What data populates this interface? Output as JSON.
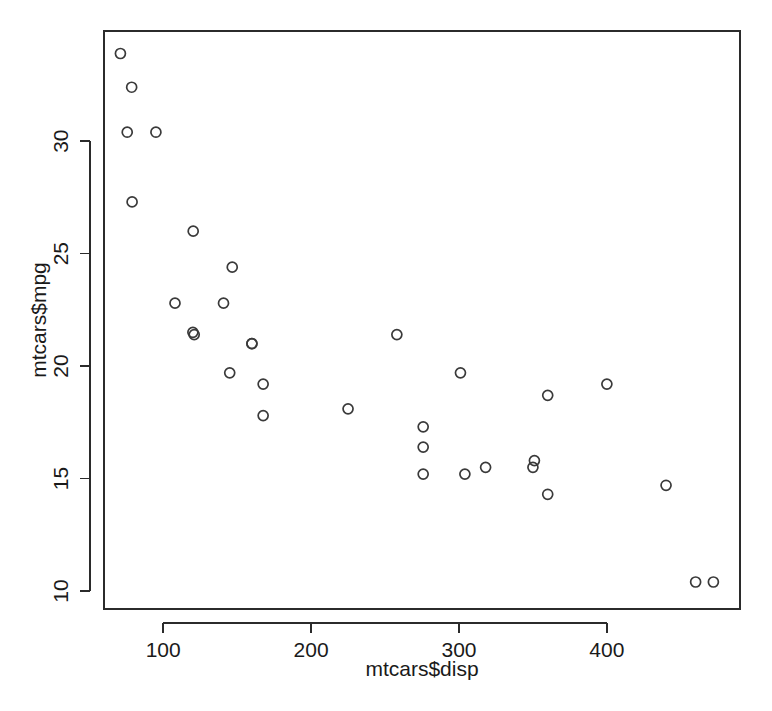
{
  "figure": {
    "background_color": "#ffffff",
    "foreground_color": "#1a1a1a",
    "point_color": "#3a3a3a",
    "axis_color": "#2b2b2b"
  },
  "chart_data": {
    "type": "scatter",
    "title": "",
    "subtitle": "",
    "xlabel": "mtcars$disp",
    "ylabel": "mtcars$mpg",
    "xlim": [
      60.0,
      490.0
    ],
    "ylim": [
      9.2,
      34.9
    ],
    "xticks": [
      100,
      200,
      300,
      400
    ],
    "yticks": [
      10,
      15,
      20,
      25,
      30
    ],
    "xtick_labels": [
      "100",
      "200",
      "300",
      "400"
    ],
    "ytick_labels": [
      "10",
      "15",
      "20",
      "25",
      "30"
    ],
    "grid": false,
    "legend": false,
    "legend_position": "none",
    "marker": "open-circle",
    "marker_size": 5,
    "n_points": 32,
    "x": [
      160.0,
      160.0,
      108.0,
      258.0,
      360.0,
      225.0,
      360.0,
      146.7,
      140.8,
      167.6,
      167.6,
      275.8,
      275.8,
      275.8,
      472.0,
      460.0,
      440.0,
      78.7,
      75.7,
      71.1,
      120.1,
      318.0,
      304.0,
      350.0,
      400.0,
      79.0,
      120.3,
      95.1,
      351.0,
      145.0,
      301.0,
      121.0
    ],
    "y": [
      21.0,
      21.0,
      22.8,
      21.4,
      18.7,
      18.1,
      14.3,
      24.4,
      22.8,
      19.2,
      17.8,
      16.4,
      17.3,
      15.2,
      10.4,
      10.4,
      14.7,
      32.4,
      30.4,
      33.9,
      21.5,
      15.5,
      15.2,
      15.5,
      19.2,
      27.3,
      26.0,
      30.4,
      15.8,
      19.7,
      19.7,
      21.4
    ],
    "points": [
      {
        "x": 160.0,
        "y": 21.0
      },
      {
        "x": 160.0,
        "y": 21.0
      },
      {
        "x": 108.0,
        "y": 22.8
      },
      {
        "x": 258.0,
        "y": 21.4
      },
      {
        "x": 360.0,
        "y": 18.7
      },
      {
        "x": 225.0,
        "y": 18.1
      },
      {
        "x": 360.0,
        "y": 14.3
      },
      {
        "x": 146.7,
        "y": 24.4
      },
      {
        "x": 140.8,
        "y": 22.8
      },
      {
        "x": 167.6,
        "y": 19.2
      },
      {
        "x": 167.6,
        "y": 17.8
      },
      {
        "x": 275.8,
        "y": 16.4
      },
      {
        "x": 275.8,
        "y": 17.3
      },
      {
        "x": 275.8,
        "y": 15.2
      },
      {
        "x": 472.0,
        "y": 10.4
      },
      {
        "x": 460.0,
        "y": 10.4
      },
      {
        "x": 440.0,
        "y": 14.7
      },
      {
        "x": 78.7,
        "y": 32.4
      },
      {
        "x": 75.7,
        "y": 30.4
      },
      {
        "x": 71.1,
        "y": 33.9
      },
      {
        "x": 120.1,
        "y": 21.5
      },
      {
        "x": 318.0,
        "y": 15.5
      },
      {
        "x": 304.0,
        "y": 15.2
      },
      {
        "x": 350.0,
        "y": 15.5
      },
      {
        "x": 400.0,
        "y": 19.2
      },
      {
        "x": 79.0,
        "y": 27.3
      },
      {
        "x": 120.3,
        "y": 26.0
      },
      {
        "x": 95.1,
        "y": 30.4
      },
      {
        "x": 351.0,
        "y": 15.8
      },
      {
        "x": 145.0,
        "y": 19.7
      },
      {
        "x": 301.0,
        "y": 19.7
      },
      {
        "x": 121.0,
        "y": 21.4
      }
    ]
  }
}
